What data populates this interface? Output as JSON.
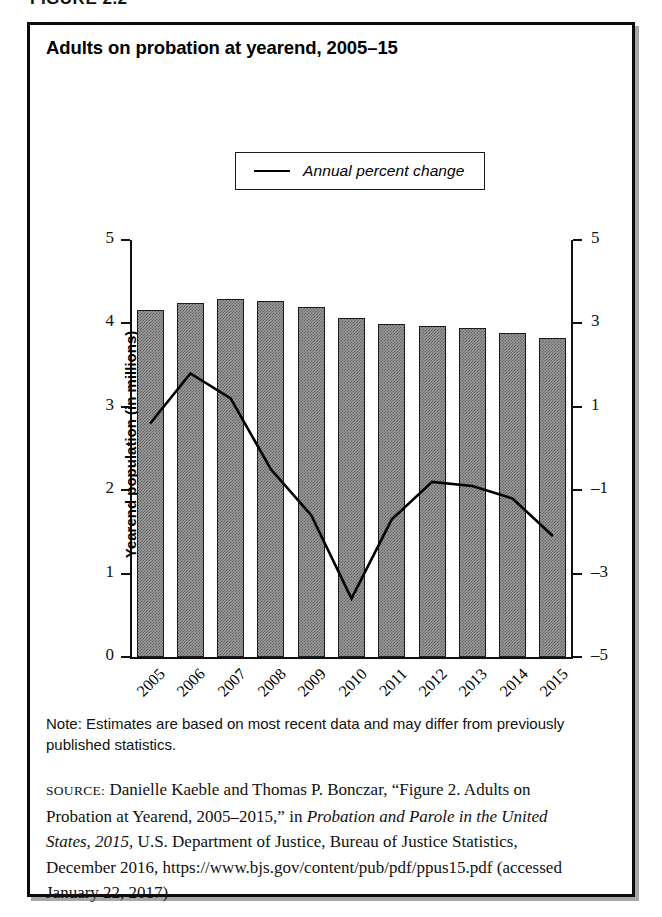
{
  "figure_caption": "FIGURE 2.2",
  "title": "Adults on probation at yearend, 2005–15",
  "legend": {
    "marker": "line-marker",
    "label": "Annual percent change"
  },
  "axes": {
    "left_title": "Yearend population (in millions)",
    "right_title": "Annual percent change",
    "left_ticks": [
      "5",
      "4",
      "3",
      "2",
      "1",
      "0"
    ],
    "right_ticks": [
      "5",
      "3",
      "1",
      "–1",
      "–3",
      "–5"
    ]
  },
  "note": {
    "label": "Note:",
    "text": "Note: Estimates are based on most recent data and may differ from previously published statistics."
  },
  "source": {
    "label": "SOURCE:",
    "part1": " Danielle Kaeble and Thomas P. Bonczar, “Figure 2. Adults on Probation at Yearend, 2005–2015,” in ",
    "italic1": "Probation and Parole in the United States, 2015",
    "part2": ", U.S. Department of Justice, Bureau of Justice Statistics, December 2016, https://www.bjs.gov/content/pub/pdf/ppus15.pdf (accessed January 22, 2017)"
  },
  "colors": {
    "bar_fill": "#9a9a9a",
    "bar_border": "#1b1b1b",
    "line": "#000000",
    "frame": "#0c0c0c"
  },
  "chart_data": {
    "type": "bar",
    "title": "Adults on probation at yearend, 2005–15",
    "xlabel": "",
    "ylabel": "Yearend population (in millions)",
    "y2label": "Annual percent change",
    "categories": [
      "2005",
      "2006",
      "2007",
      "2008",
      "2009",
      "2010",
      "2011",
      "2012",
      "2013",
      "2014",
      "2015"
    ],
    "ylim": [
      0,
      5
    ],
    "y2lim": [
      -5,
      5
    ],
    "grid": false,
    "legend_position": "top-center",
    "series": [
      {
        "name": "Yearend population (in millions)",
        "type": "bar",
        "axis": "left",
        "values": [
          4.16,
          4.24,
          4.29,
          4.27,
          4.2,
          4.06,
          3.99,
          3.97,
          3.94,
          3.89,
          3.82
        ]
      },
      {
        "name": "Annual percent change",
        "type": "line",
        "axis": "right",
        "values": [
          0.6,
          1.8,
          1.2,
          -0.5,
          -1.6,
          -3.6,
          -1.7,
          -0.8,
          -0.9,
          -1.2,
          -2.1
        ]
      }
    ]
  }
}
